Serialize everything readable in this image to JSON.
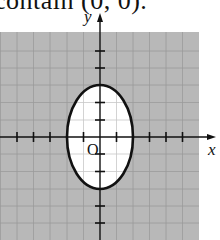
{
  "caption": {
    "text": "contain (0, 0)."
  },
  "graph": {
    "x_axis_label": "x",
    "y_axis_label": "y",
    "origin_label": "O",
    "shaded_color": "#b8b8b8",
    "grid_color": "#9a9a9a",
    "ellipse": {
      "center": [
        0,
        0
      ],
      "semi_axis_x": 2,
      "semi_axis_y": 3,
      "interior": "unshaded",
      "exterior": "shaded"
    },
    "x_ticks": [
      -5,
      -4,
      -3,
      -2,
      -1,
      1,
      2,
      3,
      4,
      5
    ],
    "y_ticks": [
      -5,
      -4,
      -3,
      -2,
      -1,
      1,
      2,
      3,
      4,
      5
    ]
  }
}
